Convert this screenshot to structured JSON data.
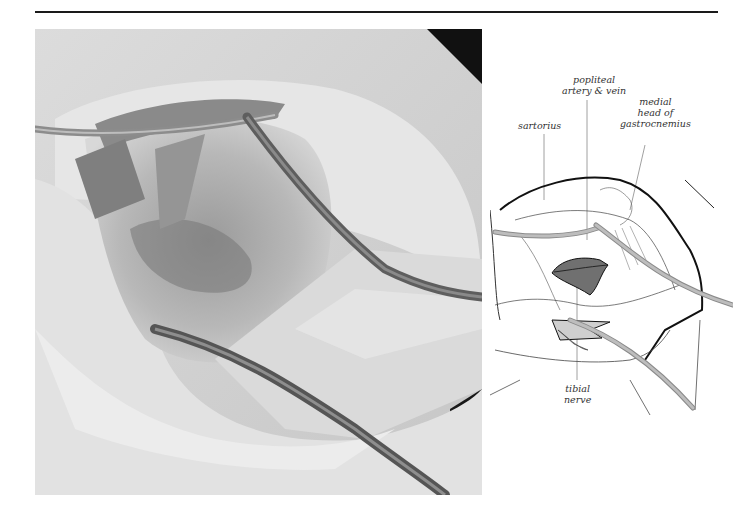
{
  "page": {
    "header_rule": true
  },
  "photo": {
    "description": "Surgical photograph of posterior knee approach showing exposed popliteal fossa with retractors",
    "tone": "grayscale"
  },
  "diagram": {
    "labels": {
      "popliteal": "popliteal\nartery & vein",
      "popliteal_line1": "popliteal",
      "popliteal_line2": "artery & vein",
      "sartorius": "sartorius",
      "gastro_line1": "medial",
      "gastro_line2": "head of",
      "gastro_line3": "gastrocnemius",
      "tibial_line1": "tibial",
      "tibial_line2": "nerve"
    },
    "colors": {
      "outline": "#111111",
      "retractor": "#b5b5b5",
      "vessel": "#6f6f6f",
      "nerve": "#c9c9c9",
      "leader": "#888888"
    }
  }
}
